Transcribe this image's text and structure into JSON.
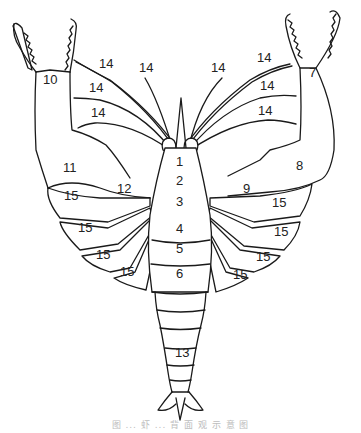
{
  "diagram": {
    "labels": [
      {
        "id": "l1",
        "text": "1",
        "x": 180,
        "y": 166
      },
      {
        "id": "l2",
        "text": "2",
        "x": 180,
        "y": 185
      },
      {
        "id": "l3",
        "text": "3",
        "x": 180,
        "y": 206
      },
      {
        "id": "l4",
        "text": "4",
        "x": 180,
        "y": 233
      },
      {
        "id": "l5",
        "text": "5",
        "x": 180,
        "y": 253
      },
      {
        "id": "l6",
        "text": "6",
        "x": 180,
        "y": 278
      },
      {
        "id": "l7",
        "text": "7",
        "x": 313,
        "y": 77
      },
      {
        "id": "l8",
        "text": "8",
        "x": 300,
        "y": 170
      },
      {
        "id": "l9",
        "text": "9",
        "x": 247,
        "y": 193
      },
      {
        "id": "l10",
        "text": "10",
        "x": 50,
        "y": 84
      },
      {
        "id": "l11",
        "text": "11",
        "x": 70,
        "y": 172
      },
      {
        "id": "l12",
        "text": "12",
        "x": 124,
        "y": 193
      },
      {
        "id": "l13",
        "text": "13",
        "x": 182,
        "y": 357
      },
      {
        "id": "l14a",
        "text": "14",
        "x": 106,
        "y": 68
      },
      {
        "id": "l14b",
        "text": "14",
        "x": 146,
        "y": 72
      },
      {
        "id": "l14c",
        "text": "14",
        "x": 96,
        "y": 92
      },
      {
        "id": "l14d",
        "text": "14",
        "x": 98,
        "y": 117
      },
      {
        "id": "l14e",
        "text": "14",
        "x": 218,
        "y": 72
      },
      {
        "id": "l14f",
        "text": "14",
        "x": 264,
        "y": 62
      },
      {
        "id": "l14g",
        "text": "14",
        "x": 267,
        "y": 90
      },
      {
        "id": "l14h",
        "text": "14",
        "x": 265,
        "y": 115
      },
      {
        "id": "l15a",
        "text": "15",
        "x": 71,
        "y": 200
      },
      {
        "id": "l15b",
        "text": "15",
        "x": 85,
        "y": 232
      },
      {
        "id": "l15c",
        "text": "15",
        "x": 103,
        "y": 259
      },
      {
        "id": "l15d",
        "text": "15",
        "x": 127,
        "y": 276
      },
      {
        "id": "l15e",
        "text": "15",
        "x": 279,
        "y": 207
      },
      {
        "id": "l15f",
        "text": "15",
        "x": 281,
        "y": 236
      },
      {
        "id": "l15g",
        "text": "15",
        "x": 263,
        "y": 261
      },
      {
        "id": "l15h",
        "text": "15",
        "x": 240,
        "y": 279
      }
    ],
    "caption": "图 ... 虾 ... 背 面 观 示 意 图"
  }
}
